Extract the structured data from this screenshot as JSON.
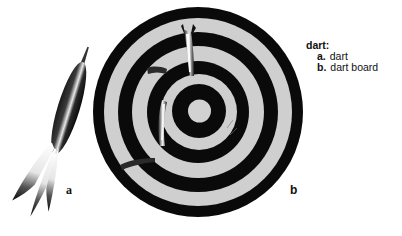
{
  "legend": {
    "term": "dart:",
    "items": [
      {
        "key": "a.",
        "label": "dart"
      },
      {
        "key": "b.",
        "label": "dart board"
      }
    ]
  },
  "figure_labels": {
    "a": "a",
    "b": "b"
  },
  "colors": {
    "ring_dark": "#0a0a0a",
    "ring_light": "#cfcfcf",
    "background": "#ffffff"
  }
}
